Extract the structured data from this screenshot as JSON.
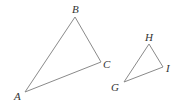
{
  "diagram": {
    "stroke_color": "#8a8a8a",
    "label_color": "#333333",
    "triangles": [
      {
        "name": "ABC",
        "vertices": [
          {
            "label": "A",
            "x": 25,
            "y": 92,
            "lx": 14,
            "ly": 100
          },
          {
            "label": "B",
            "x": 75,
            "y": 17,
            "lx": 72,
            "ly": 13
          },
          {
            "label": "C",
            "x": 101,
            "y": 62,
            "lx": 103,
            "ly": 68
          }
        ]
      },
      {
        "name": "GHI",
        "vertices": [
          {
            "label": "G",
            "x": 124,
            "y": 82,
            "lx": 111,
            "ly": 91
          },
          {
            "label": "H",
            "x": 149,
            "y": 44,
            "lx": 145,
            "ly": 41
          },
          {
            "label": "I",
            "x": 163,
            "y": 67,
            "lx": 166,
            "ly": 72
          }
        ]
      }
    ]
  }
}
